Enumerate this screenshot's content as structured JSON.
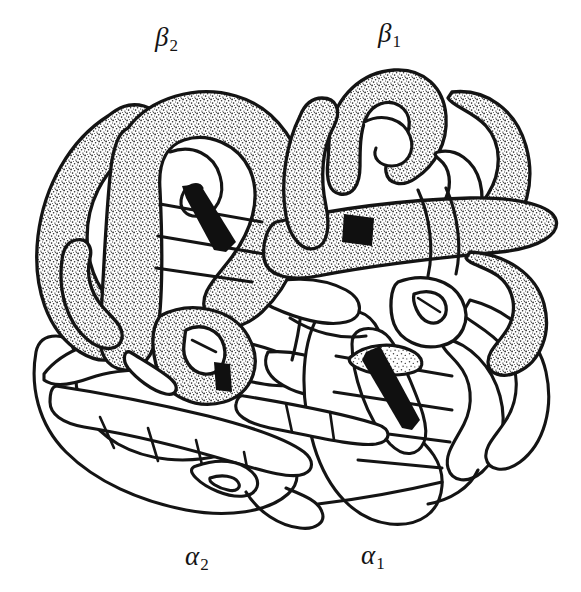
{
  "figure": {
    "style": "hand-drawn ink line diagram with stipple shading",
    "background_color": "#ffffff",
    "ink_color": "#141414",
    "stipple_color": "#2a2a2a",
    "heme_color": "#101010",
    "width": 581,
    "height": 592
  },
  "labels": {
    "beta2": {
      "glyph": "β",
      "subscript": "2",
      "x": 155,
      "y": 24
    },
    "beta1": {
      "glyph": "β",
      "subscript": "1",
      "x": 378,
      "y": 20
    },
    "alpha2": {
      "glyph": "α",
      "subscript": "2",
      "x": 185,
      "y": 543
    },
    "alpha1": {
      "glyph": "α",
      "subscript": "1",
      "x": 361,
      "y": 542
    }
  },
  "subunits": [
    {
      "id": "beta2",
      "label": "β₂",
      "position": "upper-left",
      "shading": "stippled",
      "heme": "visible"
    },
    {
      "id": "beta1",
      "label": "β₁",
      "position": "upper-right",
      "shading": "stippled",
      "heme": "visible"
    },
    {
      "id": "alpha2",
      "label": "α₂",
      "position": "lower-left",
      "shading": "plain-outline",
      "heme": "visible"
    },
    {
      "id": "alpha1",
      "label": "α₁",
      "position": "lower-right",
      "shading": "plain-outline",
      "heme": "visible"
    }
  ],
  "hemes": [
    {
      "subunit": "beta2",
      "orientation": "edge-on-diagonal",
      "cx": 207,
      "cy": 217
    },
    {
      "subunit": "beta1",
      "orientation": "edge-on-short",
      "cx": 357,
      "cy": 229
    },
    {
      "subunit": "alpha2",
      "orientation": "edge-on-short",
      "cx": 224,
      "cy": 381
    },
    {
      "subunit": "alpha1",
      "orientation": "edge-on-diagonal",
      "cx": 395,
      "cy": 392
    }
  ]
}
